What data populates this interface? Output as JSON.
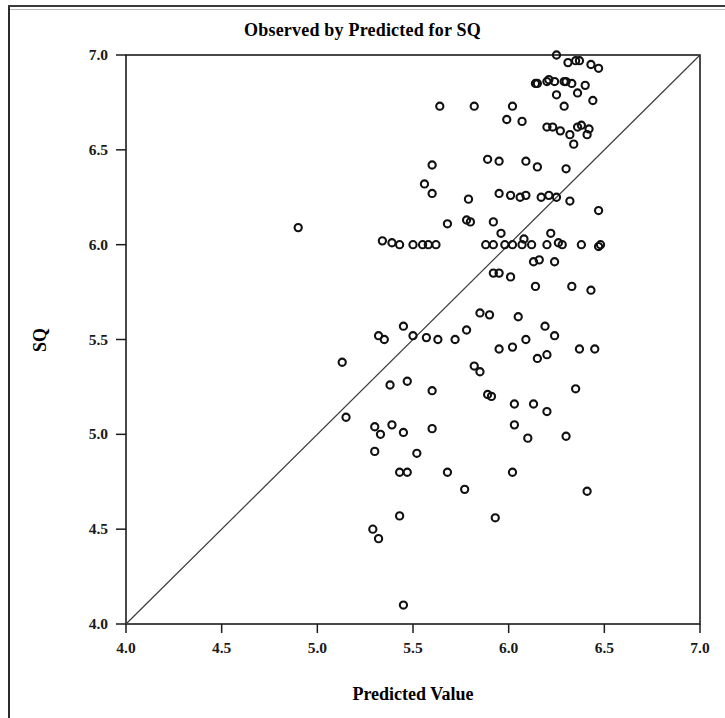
{
  "chart_data": {
    "type": "scatter",
    "title": "Observed by Predicted for SQ",
    "xlabel": "Predicted Value",
    "ylabel": "SQ",
    "xlim": [
      4.0,
      7.0
    ],
    "ylim": [
      4.0,
      7.0
    ],
    "xticks": [
      "4.0",
      "4.5",
      "5.0",
      "5.5",
      "6.0",
      "6.5",
      "7.0"
    ],
    "xtick_values": [
      4.0,
      4.5,
      5.0,
      5.5,
      6.0,
      6.5,
      7.0
    ],
    "yticks": [
      "4.0",
      "4.5",
      "5.0",
      "5.5",
      "6.0",
      "6.5",
      "7.0"
    ],
    "ytick_values": [
      4.0,
      4.5,
      5.0,
      5.5,
      6.0,
      6.5,
      7.0
    ],
    "grid": false,
    "legend": "none",
    "marker": "open-circle",
    "marker_color": "#111111",
    "reference_line": {
      "name": "identity-line",
      "from": [
        4.0,
        4.0
      ],
      "to": [
        7.0,
        7.0
      ],
      "color": "#3c3c3c"
    },
    "x": [
      6.02,
      5.82,
      6.25,
      6.31,
      6.35,
      6.37,
      6.43,
      6.47,
      6.2,
      6.24,
      6.29,
      6.14,
      6.15,
      6.21,
      6.3,
      6.33,
      6.4,
      6.25,
      6.36,
      6.44,
      6.29,
      5.64,
      6.07,
      5.99,
      5.6,
      5.89,
      5.95,
      6.2,
      6.23,
      6.36,
      6.38,
      6.42,
      6.27,
      6.32,
      6.41,
      6.34,
      6.09,
      6.15,
      6.3,
      4.9,
      5.56,
      5.6,
      5.79,
      5.95,
      6.01,
      6.06,
      6.09,
      6.17,
      6.21,
      6.25,
      6.32,
      6.47,
      5.78,
      5.8,
      5.92,
      5.68,
      5.96,
      6.08,
      6.22,
      5.34,
      5.39,
      5.98,
      6.26,
      5.62,
      5.43,
      5.5,
      5.55,
      5.58,
      5.88,
      5.92,
      6.02,
      6.07,
      6.12,
      6.2,
      6.28,
      6.38,
      6.13,
      6.16,
      6.24,
      5.92,
      5.95,
      6.01,
      6.14,
      6.33,
      6.43,
      6.05,
      5.85,
      5.9,
      6.19,
      5.13,
      5.45,
      5.32,
      5.35,
      5.5,
      5.57,
      5.63,
      5.72,
      5.95,
      6.02,
      6.2,
      6.45,
      5.38,
      5.47,
      5.6,
      5.91,
      6.03,
      6.35,
      5.3,
      5.33,
      5.45,
      5.43,
      5.15,
      5.3,
      5.29,
      6.41,
      5.45
    ],
    "y": [
      6.73,
      6.73,
      7.0,
      6.96,
      6.97,
      6.97,
      6.95,
      6.93,
      6.86,
      6.86,
      6.86,
      6.85,
      6.85,
      6.87,
      6.86,
      6.85,
      6.84,
      6.79,
      6.8,
      6.76,
      6.73,
      6.73,
      6.65,
      6.66,
      6.42,
      6.45,
      6.44,
      6.62,
      6.62,
      6.62,
      6.63,
      6.61,
      6.6,
      6.58,
      6.58,
      6.53,
      6.44,
      6.41,
      6.4,
      6.09,
      6.32,
      6.27,
      6.24,
      6.27,
      6.26,
      6.25,
      6.26,
      6.25,
      6.26,
      6.25,
      6.23,
      6.18,
      6.13,
      6.12,
      6.12,
      6.11,
      6.06,
      6.03,
      6.06,
      6.02,
      6.01,
      6.0,
      6.01,
      6.0,
      6.0,
      6.0,
      6.0,
      6.0,
      6.0,
      6.0,
      6.0,
      6.0,
      6.0,
      6.0,
      6.0,
      6.0,
      5.91,
      5.92,
      5.91,
      5.85,
      5.85,
      5.83,
      5.78,
      5.78,
      5.76,
      5.62,
      5.64,
      5.63,
      5.57,
      5.38,
      5.57,
      5.52,
      5.5,
      5.52,
      5.51,
      5.5,
      5.5,
      5.45,
      5.46,
      5.42,
      5.45,
      5.26,
      5.28,
      5.23,
      5.2,
      5.16,
      5.24,
      5.04,
      5.0,
      5.01,
      4.8,
      5.09,
      4.91,
      4.5,
      4.7,
      4.1
    ],
    "extra_points": [
      {
        "x": 5.68,
        "y": 4.8
      },
      {
        "x": 6.02,
        "y": 4.8
      },
      {
        "x": 6.1,
        "y": 4.98
      },
      {
        "x": 6.3,
        "y": 4.99
      },
      {
        "x": 6.03,
        "y": 5.05
      },
      {
        "x": 5.93,
        "y": 4.56
      },
      {
        "x": 5.77,
        "y": 4.71
      },
      {
        "x": 5.43,
        "y": 4.57
      },
      {
        "x": 5.32,
        "y": 4.45
      },
      {
        "x": 5.6,
        "y": 5.03
      },
      {
        "x": 5.39,
        "y": 5.05
      },
      {
        "x": 5.52,
        "y": 4.9
      },
      {
        "x": 5.47,
        "y": 4.8
      },
      {
        "x": 6.2,
        "y": 5.12
      },
      {
        "x": 6.13,
        "y": 5.16
      },
      {
        "x": 6.37,
        "y": 5.45
      },
      {
        "x": 6.24,
        "y": 5.52
      },
      {
        "x": 6.15,
        "y": 5.4
      },
      {
        "x": 6.09,
        "y": 5.5
      },
      {
        "x": 5.85,
        "y": 5.33
      },
      {
        "x": 5.82,
        "y": 5.36
      },
      {
        "x": 5.89,
        "y": 5.21
      },
      {
        "x": 5.78,
        "y": 5.55
      },
      {
        "x": 6.47,
        "y": 5.99
      },
      {
        "x": 6.48,
        "y": 6.0
      }
    ]
  }
}
